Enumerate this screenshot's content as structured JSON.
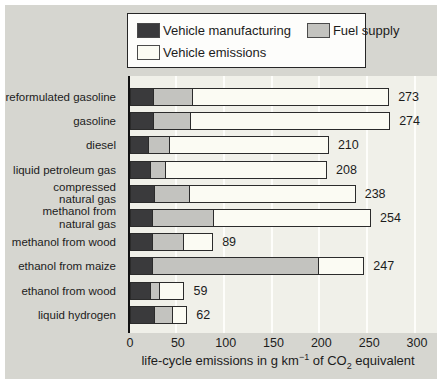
{
  "figure": {
    "outer_background": "#ffffff",
    "panel_background": "#d6d6d0",
    "plot_background": "#f0f0e9",
    "gridline_color": "#fdfdfa",
    "border_color": "#2b2b2b"
  },
  "legend": {
    "items": [
      {
        "label": "Vehicle manufacturing"
      },
      {
        "label": "Fuel supply"
      },
      {
        "label": "Vehicle emissions"
      }
    ]
  },
  "chart_data": {
    "type": "bar",
    "orientation": "horizontal",
    "stacked": true,
    "title": "",
    "xlabel": "life-cycle emissions in g km-1 of CO2 equivalent",
    "xlabel_parts": {
      "pre": "life-cycle emissions in g km",
      "sup": "−1",
      "mid": " of CO",
      "sub": "2",
      "post": " equivalent"
    },
    "xlim": [
      0,
      300
    ],
    "xticks": [
      0,
      50,
      100,
      150,
      200,
      250,
      300
    ],
    "xtick_labels": [
      "0",
      "50",
      "100",
      "150",
      "200",
      "250",
      "300"
    ],
    "grid": true,
    "legend_position": "top",
    "categories": [
      "reformulated gasoline",
      "gasoline",
      "diesel",
      "liquid petroleum gas",
      "compressed natural gas",
      "methanol from natural gas",
      "methanol from wood",
      "ethanol from maize",
      "ethanol from wood",
      "liquid hydrogen"
    ],
    "category_display": [
      "reformulated gasoline",
      "gasoline",
      "diesel",
      "liquid petroleum gas",
      "compressed\nnatural gas",
      "methanol from\nnatural gas",
      "methanol from wood",
      "ethanol from maize",
      "ethanol from wood",
      "liquid hydrogen"
    ],
    "series": [
      {
        "name": "Vehicle manufacturing",
        "color": "#3a3a3c",
        "values": [
          25,
          25,
          20,
          22,
          26,
          24,
          24,
          24,
          22,
          26
        ]
      },
      {
        "name": "Fuel supply",
        "color": "#c3c3bf",
        "values": [
          42,
          40,
          23,
          17,
          38,
          65,
          34,
          175,
          10,
          20
        ]
      },
      {
        "name": "Vehicle emissions",
        "color": "#fbfbf3",
        "values": [
          206,
          209,
          167,
          169,
          174,
          165,
          31,
          48,
          27,
          16
        ]
      }
    ],
    "totals": [
      273,
      274,
      210,
      208,
      238,
      254,
      89,
      247,
      59,
      62
    ]
  }
}
